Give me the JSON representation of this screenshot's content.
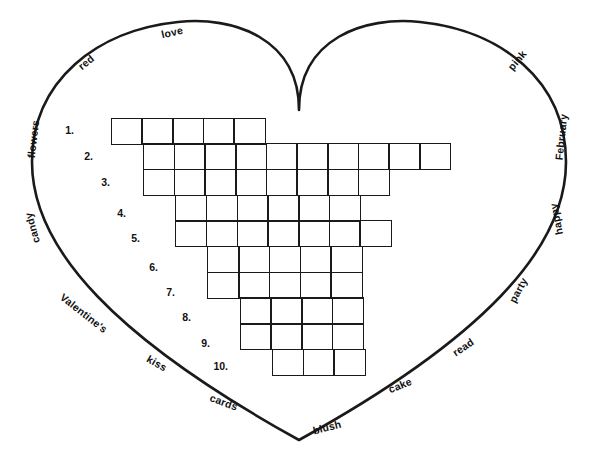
{
  "puzzle": {
    "title": "Valentine's Heart Word Puzzle",
    "shape": "heart",
    "cell_size": 32.3,
    "grid_origin_x": 110.5,
    "grid_origin_y": 117.5,
    "row_count": 10,
    "column_count": 11,
    "border_color": "#1a1a1a",
    "word_bank": [
      {
        "text": "love",
        "x": 172,
        "y": 32,
        "rotate": -13
      },
      {
        "text": "red",
        "x": 86,
        "y": 62,
        "rotate": -40
      },
      {
        "text": "flowers",
        "x": 33,
        "y": 139,
        "rotate": -83
      },
      {
        "text": "candy",
        "x": 32,
        "y": 228,
        "rotate": -105
      },
      {
        "text": "Valentine's",
        "x": 84,
        "y": 313,
        "rotate": 38
      },
      {
        "text": "kiss",
        "x": 157,
        "y": 363,
        "rotate": 30
      },
      {
        "text": "cards",
        "x": 224,
        "y": 402,
        "rotate": 20
      },
      {
        "text": "blush",
        "x": 327,
        "y": 427,
        "rotate": -14
      },
      {
        "text": "cake",
        "x": 400,
        "y": 385,
        "rotate": -22
      },
      {
        "text": "read",
        "x": 463,
        "y": 347,
        "rotate": -34
      },
      {
        "text": "party",
        "x": 518,
        "y": 290,
        "rotate": -62
      },
      {
        "text": "happy",
        "x": 556,
        "y": 219,
        "rotate": -101
      },
      {
        "text": "February",
        "x": 561,
        "y": 137,
        "rotate": -84
      },
      {
        "text": "pink",
        "x": 517,
        "y": 60,
        "rotate": -50
      }
    ],
    "rows": [
      {
        "number": "1.",
        "start_col": 0,
        "cells": 5,
        "label_x": 74,
        "label_y": 130
      },
      {
        "number": "2.",
        "start_col": 1,
        "cells": 10,
        "label_x": 93,
        "label_y": 156
      },
      {
        "number": "3.",
        "start_col": 1,
        "cells": 8,
        "label_x": 110,
        "label_y": 182
      },
      {
        "number": "4.",
        "start_col": 2,
        "cells": 6,
        "label_x": 126,
        "label_y": 213
      },
      {
        "number": "5.",
        "start_col": 2,
        "cells": 7,
        "label_x": 140,
        "label_y": 238
      },
      {
        "number": "6.",
        "start_col": 3,
        "cells": 5,
        "label_x": 158,
        "label_y": 267
      },
      {
        "number": "7.",
        "start_col": 3,
        "cells": 5,
        "label_x": 175,
        "label_y": 292
      },
      {
        "number": "8.",
        "start_col": 4,
        "cells": 4,
        "label_x": 191,
        "label_y": 317
      },
      {
        "number": "9.",
        "start_col": 4,
        "cells": 4,
        "label_x": 210,
        "label_y": 343
      },
      {
        "number": "10.",
        "start_col": 5,
        "cells": 3,
        "label_x": 228,
        "label_y": 366
      }
    ]
  }
}
